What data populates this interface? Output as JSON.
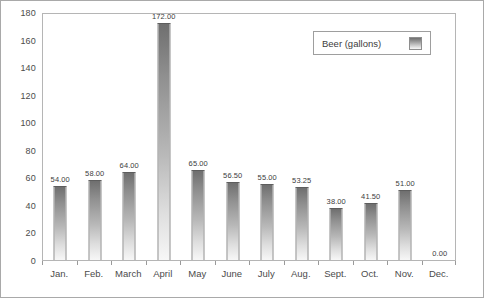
{
  "chart_data": {
    "type": "bar",
    "title": "",
    "xlabel": "",
    "ylabel": "",
    "ylim": [
      0,
      180
    ],
    "ytick_step": 20,
    "yticks": [
      0,
      20,
      40,
      60,
      80,
      100,
      120,
      140,
      160,
      180
    ],
    "grid": false,
    "legend_position": "top-right",
    "categories": [
      "Jan.",
      "Feb.",
      "March",
      "April",
      "May",
      "June",
      "July",
      "Aug.",
      "Sept.",
      "Oct.",
      "Nov.",
      "Dec."
    ],
    "values": [
      54.0,
      58.0,
      64.0,
      172.0,
      65.0,
      56.5,
      55.0,
      53.25,
      38.0,
      41.5,
      51.0,
      0.0
    ],
    "value_labels": [
      "54.00",
      "58.00",
      "64.00",
      "172.00",
      "65.00",
      "56.50",
      "55.00",
      "53.25",
      "38.00",
      "41.50",
      "51.00",
      "0.00"
    ],
    "series": [
      {
        "name": "Beer (gallons)",
        "values": [
          54.0,
          58.0,
          64.0,
          172.0,
          65.0,
          56.5,
          55.0,
          53.25,
          38.0,
          41.5,
          51.0,
          0.0
        ]
      }
    ]
  },
  "legend": {
    "label": "Beer (gallons)",
    "swatch_name": "bar-gradient-swatch"
  },
  "colors": {
    "bar_top": "#6f6f6f",
    "bar_bottom": "#f7f7f7",
    "plot_border": "#b5b5b5",
    "outer_border": "#a9a9a9",
    "text": "#3d3d3d",
    "background": "#ffffff"
  }
}
